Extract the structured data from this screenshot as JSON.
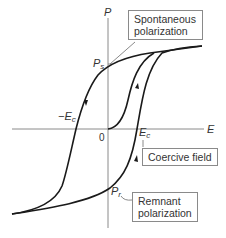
{
  "diagram": {
    "axes": {
      "x_label": "E",
      "y_label": "P",
      "origin_label": "0"
    },
    "points": {
      "ps_label": "P",
      "ps_sub": "s",
      "pr_label": "P",
      "pr_sub": "r",
      "ec_label": "E",
      "ec_sub": "c",
      "neg_ec_label": "−E",
      "neg_ec_sub": "c"
    },
    "callouts": {
      "spontaneous_line1": "Spontaneous",
      "spontaneous_line2": "polarization",
      "coercive": "Coercive field",
      "remnant_line1": "Remnant",
      "remnant_line2": "polarization"
    },
    "colors": {
      "curve": "#1a1a1a",
      "axis": "#8a8a8a",
      "box_border": "#8a8a8a",
      "text": "#333333"
    }
  }
}
